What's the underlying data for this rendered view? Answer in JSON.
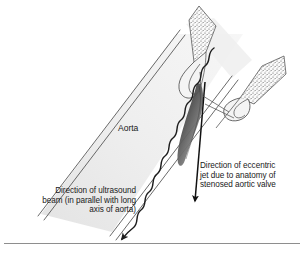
{
  "figure": {
    "bottom_rule": "horizontal-divider"
  },
  "labels": {
    "aorta": "Aorta",
    "ultrasound_beam": {
      "line1": "Direction of ultrasound",
      "line2": "beam (in parallel with long",
      "line3": "axis of aorta)"
    },
    "eccentric_jet": {
      "line1": "Direction of eccentric",
      "line2": "jet due to anatomy of",
      "line3": "stenosed aortic valve"
    }
  },
  "anatomy": {
    "vessel_name": "aorta-lumen",
    "left_cusp_name": "aortic-valve-cusp-left",
    "right_cusp_name": "aortic-valve-cusp-right",
    "jet_name": "stenotic-jet-plume"
  },
  "colors": {
    "outline": "#4a4a4a",
    "lumen_fill": "#ececec",
    "cusp_fill": "#f7f7f7",
    "stipple": "#555555",
    "jet_dark": "#2a2a2a",
    "jet_mid": "#8a8a8a",
    "arrow": "#111111",
    "text": "#1a1a1a",
    "rule": "#8e8e8e",
    "background": "#ffffff"
  }
}
